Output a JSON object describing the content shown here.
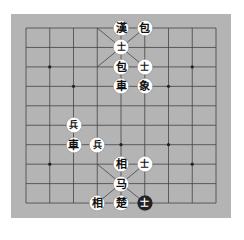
{
  "board": {
    "columns": 9,
    "rows": 10,
    "origin_x": 26,
    "origin_y": 28,
    "step_x": 23.75,
    "step_y": 19.45,
    "colors": {
      "board": "#b4b4b4",
      "line": "#444444",
      "piece": "#ffffff",
      "dark_piece": "#222222"
    },
    "markers": [
      {
        "col": 1,
        "row": 2
      },
      {
        "col": 7,
        "row": 2
      },
      {
        "col": 2,
        "row": 3
      },
      {
        "col": 6,
        "row": 3
      },
      {
        "col": 4,
        "row": 6
      },
      {
        "col": 6,
        "row": 6
      },
      {
        "col": 1,
        "row": 7
      },
      {
        "col": 7,
        "row": 7
      }
    ]
  },
  "pieces": [
    {
      "label": "漢",
      "col": 4,
      "row": 0,
      "style": "light"
    },
    {
      "label": "包",
      "col": 5,
      "row": 0,
      "style": "light"
    },
    {
      "label": "士",
      "col": 4,
      "row": 1,
      "style": "light",
      "small": true
    },
    {
      "label": "包",
      "col": 4,
      "row": 2,
      "style": "light"
    },
    {
      "label": "士",
      "col": 5,
      "row": 2,
      "style": "light",
      "small": true
    },
    {
      "label": "車",
      "col": 4,
      "row": 3,
      "style": "light"
    },
    {
      "label": "象",
      "col": 5,
      "row": 3,
      "style": "light"
    },
    {
      "label": "兵",
      "col": 2,
      "row": 5,
      "style": "light",
      "small": true
    },
    {
      "label": "車",
      "col": 2,
      "row": 6,
      "style": "light"
    },
    {
      "label": "兵",
      "col": 3,
      "row": 6,
      "style": "light",
      "small": true
    },
    {
      "label": "相",
      "col": 4,
      "row": 7,
      "style": "light"
    },
    {
      "label": "士",
      "col": 5,
      "row": 7,
      "style": "light",
      "small": true
    },
    {
      "label": "马",
      "col": 4,
      "row": 8,
      "style": "light"
    },
    {
      "label": "相",
      "col": 3,
      "row": 9,
      "style": "light"
    },
    {
      "label": "楚",
      "col": 4,
      "row": 9,
      "style": "light"
    },
    {
      "label": "士",
      "col": 5,
      "row": 9,
      "style": "dark",
      "small": true
    }
  ]
}
